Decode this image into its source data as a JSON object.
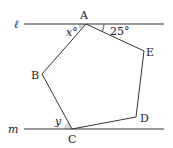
{
  "diagram": {
    "lines": [
      {
        "name": "ℓ",
        "y": 24
      },
      {
        "name": "m",
        "y": 129
      }
    ],
    "vertices": {
      "A": {
        "label": "A",
        "x": 86,
        "y": 24
      },
      "B": {
        "label": "B",
        "x": 42,
        "y": 74
      },
      "C": {
        "label": "C",
        "x": 72,
        "y": 129
      },
      "D": {
        "label": "D",
        "x": 136,
        "y": 117
      },
      "E": {
        "label": "E",
        "x": 144,
        "y": 51
      }
    },
    "angles": {
      "x": {
        "label": "x°",
        "at": "A"
      },
      "angle_25": {
        "label": "25°",
        "at": "A"
      },
      "y": {
        "label": "y",
        "at": "C"
      }
    },
    "shade_color": "#d8d8d8",
    "line_color": "#333333"
  }
}
